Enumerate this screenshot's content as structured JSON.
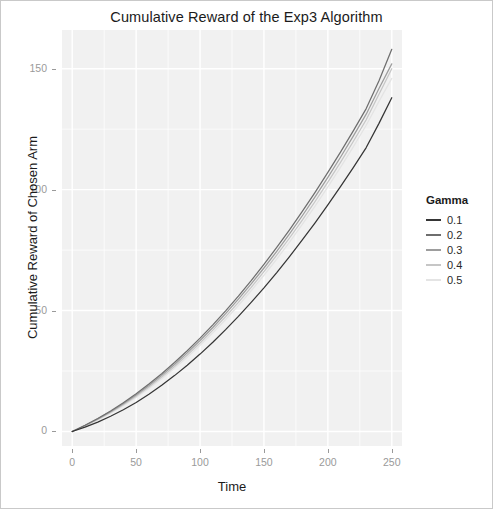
{
  "figure": {
    "title": "Cumulative Reward of the Exp3 Algorithm"
  },
  "axes": {
    "x_title": "Time",
    "y_title": "Cumulative Reward of Chosen Arm",
    "x_ticks": [
      "0",
      "50",
      "100",
      "150",
      "200",
      "250"
    ],
    "y_ticks": [
      "0",
      "50",
      "100",
      "150"
    ]
  },
  "legend": {
    "title": "Gamma",
    "entries": [
      {
        "label": "0.1",
        "color": "#353535"
      },
      {
        "label": "0.2",
        "color": "#6e6e6e"
      },
      {
        "label": "0.3",
        "color": "#9d9d9d"
      },
      {
        "label": "0.4",
        "color": "#c6c6c6"
      },
      {
        "label": "0.5",
        "color": "#e4e4e4"
      }
    ]
  },
  "chart_data": {
    "type": "line",
    "title": "Cumulative Reward of the Exp3 Algorithm",
    "xlabel": "Time",
    "ylabel": "Cumulative Reward of Chosen Arm",
    "xlim": [
      -8,
      258
    ],
    "ylim": [
      -6,
      166
    ],
    "xticks": [
      0,
      50,
      100,
      150,
      200,
      250
    ],
    "yticks": [
      0,
      50,
      100,
      150
    ],
    "grid": true,
    "legend_title": "Gamma",
    "legend_position": "right",
    "x": [
      0,
      10,
      20,
      30,
      40,
      50,
      60,
      70,
      80,
      90,
      100,
      110,
      120,
      130,
      140,
      150,
      160,
      170,
      180,
      190,
      200,
      210,
      220,
      230,
      240,
      250
    ],
    "series": [
      {
        "name": "0.1",
        "color": "#353535",
        "values": [
          0,
          1.8,
          3.9,
          6.3,
          9.0,
          12.0,
          15.4,
          19.1,
          23.1,
          27.4,
          32.0,
          36.9,
          42.1,
          47.6,
          53.4,
          59.4,
          65.7,
          72.3,
          79.2,
          86.3,
          93.7,
          101.3,
          109.2,
          117.4,
          127.4,
          138.0
        ]
      },
      {
        "name": "0.2",
        "color": "#6e6e6e",
        "values": [
          0,
          2.6,
          5.4,
          8.5,
          11.9,
          15.6,
          19.6,
          23.9,
          28.5,
          33.4,
          38.6,
          44.1,
          49.9,
          56.0,
          62.4,
          69.1,
          76.1,
          83.4,
          91.0,
          98.9,
          107.1,
          115.6,
          124.4,
          133.5,
          145.0,
          158.0
        ]
      },
      {
        "name": "0.3",
        "color": "#9d9d9d",
        "values": [
          0,
          2.5,
          5.2,
          8.2,
          11.5,
          15.1,
          19.0,
          23.2,
          27.7,
          32.5,
          37.6,
          43.0,
          48.7,
          54.7,
          61.0,
          67.6,
          74.5,
          81.7,
          89.2,
          97.0,
          105.1,
          113.5,
          122.2,
          131.2,
          141.8,
          152.0
        ]
      },
      {
        "name": "0.4",
        "color": "#c6c6c6",
        "values": [
          0,
          2.4,
          5.0,
          7.9,
          11.1,
          14.6,
          18.4,
          22.5,
          26.9,
          31.6,
          36.6,
          41.9,
          47.5,
          53.4,
          59.6,
          66.1,
          72.9,
          80.0,
          87.4,
          95.1,
          103.1,
          111.4,
          120.0,
          128.9,
          139.4,
          150.0
        ]
      },
      {
        "name": "0.5",
        "color": "#e4e4e4",
        "values": [
          0,
          2.3,
          4.8,
          7.6,
          10.7,
          14.1,
          17.8,
          21.8,
          26.1,
          30.7,
          35.6,
          40.8,
          46.3,
          52.1,
          58.2,
          64.6,
          71.3,
          78.3,
          85.6,
          93.2,
          101.1,
          109.3,
          117.8,
          126.6,
          136.5,
          146.0
        ]
      }
    ]
  }
}
